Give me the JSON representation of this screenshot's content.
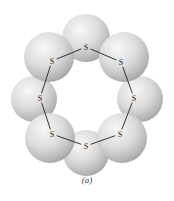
{
  "figure": {
    "caption": "(a)",
    "molecule": "S8 ring",
    "atom_label": "S",
    "atoms": [
      {
        "id": "top",
        "label": "S",
        "x": 86,
        "y": 47,
        "sx": 86,
        "sy": 38,
        "r": 24
      },
      {
        "id": "upper-right",
        "label": "S",
        "x": 121,
        "y": 62,
        "sx": 124,
        "sy": 57,
        "r": 25
      },
      {
        "id": "right",
        "label": "S",
        "x": 134,
        "y": 98,
        "sx": 140,
        "sy": 99,
        "r": 23
      },
      {
        "id": "lower-right",
        "label": "S",
        "x": 120,
        "y": 134,
        "sx": 122,
        "sy": 138,
        "r": 25
      },
      {
        "id": "bottom",
        "label": "S",
        "x": 86,
        "y": 146,
        "sx": 86,
        "sy": 153,
        "r": 23
      },
      {
        "id": "lower-left",
        "label": "S",
        "x": 52,
        "y": 134,
        "sx": 50,
        "sy": 138,
        "r": 25
      },
      {
        "id": "left",
        "label": "S",
        "x": 40,
        "y": 98,
        "sx": 34,
        "sy": 99,
        "r": 23
      },
      {
        "id": "upper-left",
        "label": "S",
        "x": 52,
        "y": 61,
        "sx": 49,
        "sy": 57,
        "r": 25
      }
    ],
    "colors": {
      "sphere_light": "#f4f4f4",
      "sphere_mid": "#d2d2d2",
      "sphere_dark": "#9a9a9a",
      "bond": "#222222",
      "text": "#222222"
    }
  }
}
